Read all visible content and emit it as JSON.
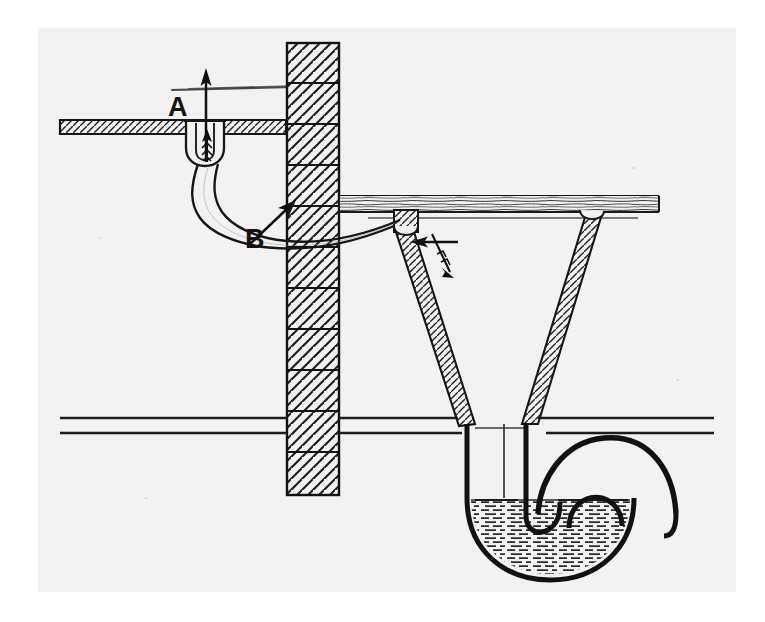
{
  "figure": {
    "medium": "engraved line drawing on aged paper",
    "paper_color": "#f3f2f0",
    "ink_color": "#141414",
    "labels": [
      {
        "id": "A",
        "text": "A",
        "meaning": "upper-floor waste outlet / untrapped drain inlet",
        "x": 130,
        "y": 66
      },
      {
        "id": "B",
        "text": "B",
        "meaning": "waste pipe leading down through the wall",
        "x": 207,
        "y": 198,
        "has_pointer_arrow": true
      }
    ],
    "elements": [
      {
        "name": "upper-floor-slab",
        "kind": "hatched floor section"
      },
      {
        "name": "masonry-wall",
        "kind": "brick wall in section, diagonal hatching, 11 courses"
      },
      {
        "name": "drain-outlet-cup",
        "kind": "U shaped untrapped outlet below floor at A"
      },
      {
        "name": "gas-flow-arrow-up",
        "kind": "arrow showing sewer gas rising into room"
      },
      {
        "name": "feather-arrow-upper",
        "kind": "feathered arrow, upward draught in waste pipe"
      },
      {
        "name": "waste-pipe",
        "kind": "curved pipe from A descending through wall, label B"
      },
      {
        "name": "lower-floor-board",
        "kind": "timber floor with grain"
      },
      {
        "name": "feather-arrow-lower",
        "kind": "feathered arrow at hopper junction"
      },
      {
        "name": "gas-flow-arrow-left",
        "kind": "arrow showing gas travelling back along pipe"
      },
      {
        "name": "hopper-vessel",
        "kind": "V shaped hopper / funnel in section"
      },
      {
        "name": "ground-line-upper",
        "kind": "ground surface line"
      },
      {
        "name": "ground-line-lower",
        "kind": "second ground surface line"
      },
      {
        "name": "trap-bend",
        "kind": "U bend water trap below ground"
      },
      {
        "name": "trap-water",
        "kind": "water seal, hatched with horizontal dashes"
      },
      {
        "name": "outlet-pipe",
        "kind": "drain outlet pipe curving up and away to the right"
      }
    ]
  },
  "geometry": {
    "wall": {
      "x": 287,
      "y": 43,
      "width": 52,
      "height": 452,
      "courses": 11
    },
    "upper_floor": {
      "x": 60,
      "y": 92,
      "width": 230,
      "height": 14
    },
    "lower_floor": {
      "x": 345,
      "y": 196,
      "width": 310,
      "height": 16
    },
    "ground_lines": [
      418,
      433
    ],
    "water_level": 500,
    "hopper": {
      "top_left": 404,
      "top_right": 580,
      "bottom_left": 470,
      "bottom_right": 523,
      "top_y": 212,
      "bottom_y": 430
    }
  }
}
